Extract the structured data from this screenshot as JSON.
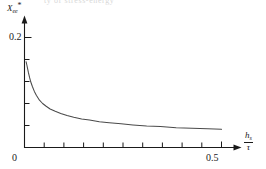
{
  "figure": {
    "cut_top_text": "ty of stress-energy",
    "axes": {
      "y_axis_label": "X",
      "y_axis_label_sub": "ee",
      "y_axis_label_sup": "*",
      "x_axis_label_numerator": "h",
      "x_axis_label_numerator_sub": "s",
      "x_axis_label_denominator": "τ",
      "origin_label": "0",
      "y_tick_labels": [
        "0.2"
      ],
      "x_tick_labels": [
        "0.5"
      ],
      "line_color": "#4a4a4a",
      "axis_color": "#1a1a1a"
    }
  },
  "chart_data": {
    "type": "line",
    "title": "",
    "subtitle": "",
    "xlabel": "h_s / τ",
    "ylabel": "X*_ee",
    "xlim": [
      0,
      0.555
    ],
    "ylim": [
      0,
      0.26
    ],
    "grid": false,
    "legend": null,
    "x_ticks": [
      0,
      0.05,
      0.1,
      0.15,
      0.2,
      0.25,
      0.3,
      0.35,
      0.4,
      0.45,
      0.5
    ],
    "x_tick_labels_shown": {
      "0": "0",
      "0.5": "0.5"
    },
    "y_ticks": [
      0,
      0.05,
      0.1,
      0.15,
      0.2,
      0.25
    ],
    "y_tick_labels_shown": {
      "0.2": "0.2"
    },
    "series": [
      {
        "name": "X*_ee vs h_s/tau",
        "x": [
          0.004,
          0.006,
          0.008,
          0.01,
          0.013,
          0.016,
          0.02,
          0.025,
          0.03,
          0.038,
          0.046,
          0.055,
          0.065,
          0.078,
          0.092,
          0.108,
          0.125,
          0.145,
          0.165,
          0.19,
          0.215,
          0.245,
          0.275,
          0.31,
          0.345,
          0.385,
          0.425,
          0.465,
          0.5
        ],
        "y": [
          0.156,
          0.15,
          0.143,
          0.136,
          0.127,
          0.119,
          0.111,
          0.102,
          0.095,
          0.086,
          0.08,
          0.075,
          0.07,
          0.066,
          0.062,
          0.058,
          0.055,
          0.052,
          0.05,
          0.047,
          0.045,
          0.043,
          0.041,
          0.039,
          0.038,
          0.036,
          0.035,
          0.034,
          0.033
        ]
      }
    ]
  }
}
